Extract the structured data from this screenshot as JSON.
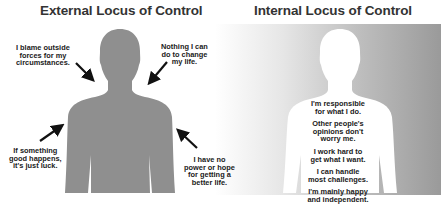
{
  "external": {
    "title": "External Locus of Control",
    "figure_color": "#8f8f8f",
    "statements": [
      {
        "id": "blame",
        "text": "I blame outside\nforces for my\ncircumstances."
      },
      {
        "id": "nothing",
        "text": "Nothing I can\ndo to change\nmy life."
      },
      {
        "id": "luck",
        "text": "If something\ngood happens,\nit's just luck."
      },
      {
        "id": "no-power",
        "text": "I have no\npower or hope\nfor getting a\nbetter life."
      }
    ]
  },
  "internal": {
    "title": "Internal Locus of Control",
    "figure_color": "#ffffff",
    "background_gradient": [
      "#ffffff",
      "#9a9a9a"
    ],
    "statements": [
      {
        "id": "responsible",
        "text": "I'm responsible\nfor what I do."
      },
      {
        "id": "opinions",
        "text": "Other people's\nopinions don't\nworry me."
      },
      {
        "id": "work-hard",
        "text": "I work hard to\nget what I want."
      },
      {
        "id": "challenges",
        "text": "I can handle\nmost challenges."
      },
      {
        "id": "happy",
        "text": "I'm mainly happy\nand independent."
      }
    ]
  }
}
